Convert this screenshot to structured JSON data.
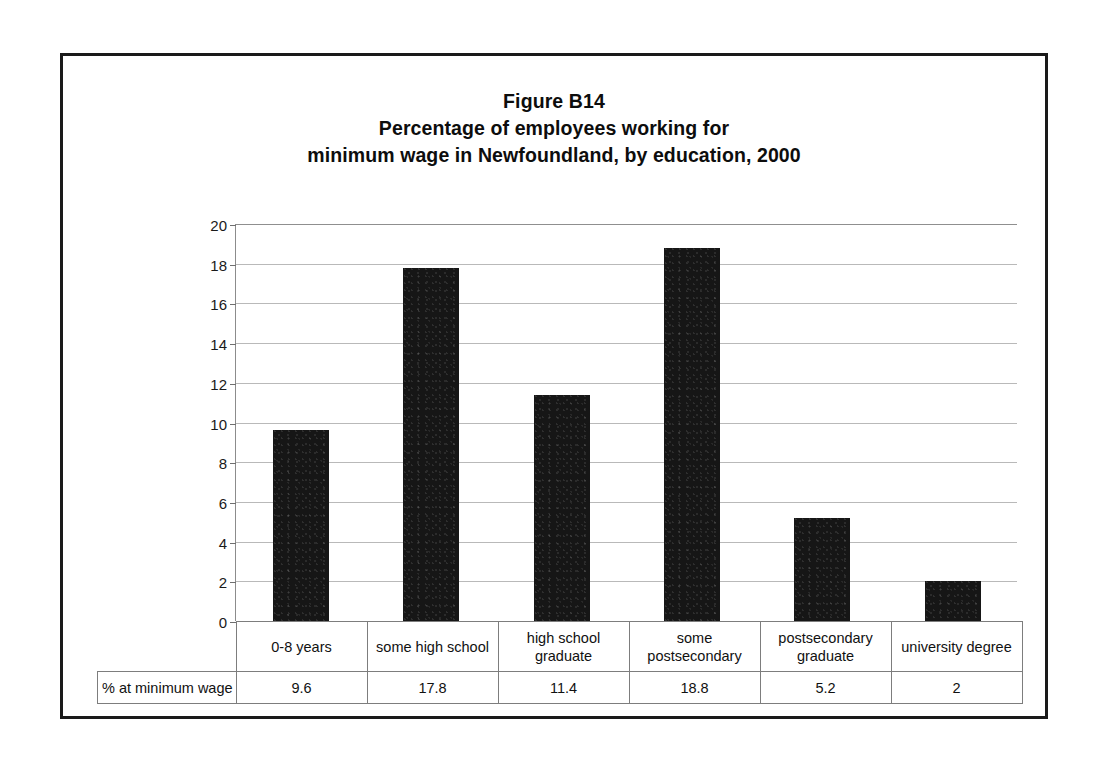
{
  "figure": {
    "border_color": "#1a1a1a",
    "background": "#ffffff"
  },
  "title": {
    "line1": "Figure B14",
    "line2": "Percentage of employees working for",
    "line3": "minimum wage in Newfoundland, by education, 2000"
  },
  "chart_data": {
    "type": "bar",
    "xlabel": "",
    "ylabel": "",
    "ylim": [
      0,
      20
    ],
    "yticks": [
      0,
      2,
      4,
      6,
      8,
      10,
      12,
      14,
      16,
      18,
      20
    ],
    "grid": true,
    "legend": "none",
    "bar_color": "#161616",
    "categories": [
      "0-8 years",
      "some high school",
      "high school graduate",
      "some postsecondary",
      "postsecondary graduate",
      "university degree"
    ],
    "series": [
      {
        "name": "% at minimum wage",
        "values": [
          9.6,
          17.8,
          11.4,
          18.8,
          5.2,
          2
        ]
      }
    ]
  },
  "table": {
    "series_label": "% at minimum wage",
    "categories": [
      {
        "line1": "0-8 years",
        "line2": ""
      },
      {
        "line1": "some high school",
        "line2": ""
      },
      {
        "line1": "high school",
        "line2": "graduate"
      },
      {
        "line1": "some",
        "line2": "postsecondary"
      },
      {
        "line1": "postsecondary",
        "line2": "graduate"
      },
      {
        "line1": "university degree",
        "line2": ""
      }
    ],
    "values": [
      "9.6",
      "17.8",
      "11.4",
      "18.8",
      "5.2",
      "2"
    ]
  },
  "axis": {
    "labels": [
      "20",
      "18",
      "16",
      "14",
      "12",
      "10",
      "8",
      "6",
      "4",
      "2",
      "0"
    ]
  }
}
